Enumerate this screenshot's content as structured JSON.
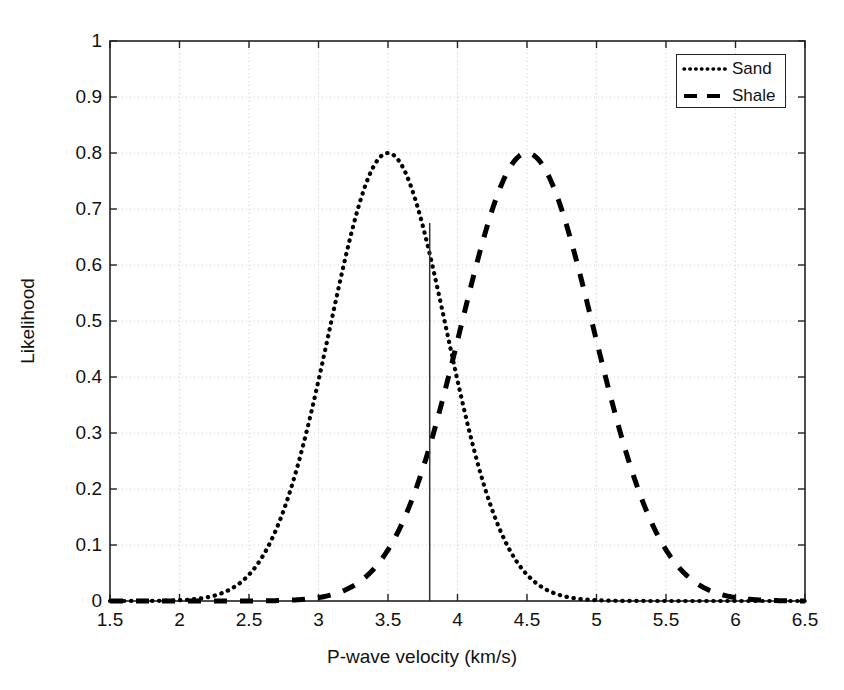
{
  "chart_data": {
    "type": "line",
    "title": "",
    "xlabel": "P-wave velocity  (km/s)",
    "ylabel": "Likelihood",
    "xlim": [
      1.5,
      6.5
    ],
    "ylim": [
      0,
      1
    ],
    "grid": true,
    "legend_position": "top-right",
    "x_ticks": [
      "1.5",
      "2",
      "2.5",
      "3",
      "3.5",
      "4",
      "4.5",
      "5",
      "5.5",
      "6",
      "6.5"
    ],
    "x_tick_values": [
      1.5,
      2,
      2.5,
      3,
      3.5,
      4,
      4.5,
      5,
      5.5,
      6,
      6.5
    ],
    "y_ticks": [
      "0",
      "0.1",
      "0.2",
      "0.3",
      "0.4",
      "0.5",
      "0.6",
      "0.7",
      "0.8",
      "0.9",
      "1"
    ],
    "y_tick_values": [
      0,
      0.1,
      0.2,
      0.3,
      0.4,
      0.5,
      0.6,
      0.7,
      0.8,
      0.9,
      1
    ],
    "series": [
      {
        "name": "Sand",
        "style": "dotted",
        "color": "#000000",
        "peak_x": 3.5,
        "peak_y": 0.8,
        "sigma": 0.42,
        "x": [
          1.5,
          1.6,
          1.7,
          1.8,
          1.9,
          2.0,
          2.1,
          2.2,
          2.3,
          2.4,
          2.5,
          2.6,
          2.7,
          2.8,
          2.9,
          3.0,
          3.1,
          3.2,
          3.3,
          3.4,
          3.5,
          3.6,
          3.7,
          3.8,
          3.9,
          4.0,
          4.1,
          4.2,
          4.3,
          4.4,
          4.5,
          4.6,
          4.7,
          4.8,
          4.9,
          5.0,
          5.1,
          5.2,
          5.3,
          5.4,
          5.5,
          5.6,
          5.7,
          5.8,
          5.9,
          6.0,
          6.1,
          6.2,
          6.3,
          6.4,
          6.5
        ],
        "values": [
          0.0,
          0.001,
          0.002,
          0.004,
          0.008,
          0.015,
          0.027,
          0.046,
          0.075,
          0.115,
          0.17,
          0.24,
          0.322,
          0.412,
          0.503,
          0.587,
          0.659,
          0.715,
          0.757,
          0.785,
          0.8,
          0.785,
          0.757,
          0.715,
          0.659,
          0.587,
          0.503,
          0.412,
          0.322,
          0.24,
          0.17,
          0.115,
          0.075,
          0.046,
          0.027,
          0.015,
          0.008,
          0.004,
          0.002,
          0.001,
          0.0,
          0.0,
          0.0,
          0.0,
          0.0,
          0.0,
          0.0,
          0.0,
          0.0,
          0.0,
          0.0
        ]
      },
      {
        "name": "Shale",
        "style": "dashed",
        "color": "#000000",
        "peak_x": 4.5,
        "peak_y": 0.8,
        "sigma": 0.48,
        "x": [
          1.5,
          1.6,
          1.7,
          1.8,
          1.9,
          2.0,
          2.1,
          2.2,
          2.3,
          2.4,
          2.5,
          2.6,
          2.7,
          2.8,
          2.9,
          3.0,
          3.1,
          3.2,
          3.3,
          3.4,
          3.5,
          3.6,
          3.7,
          3.8,
          3.9,
          4.0,
          4.1,
          4.2,
          4.3,
          4.4,
          4.5,
          4.6,
          4.7,
          4.8,
          4.9,
          5.0,
          5.1,
          5.2,
          5.3,
          5.4,
          5.5,
          5.6,
          5.7,
          5.8,
          5.9,
          6.0,
          6.1,
          6.2,
          6.3,
          6.4,
          6.5
        ],
        "values": [
          0.0,
          0.0,
          0.0,
          0.0,
          0.001,
          0.001,
          0.002,
          0.004,
          0.007,
          0.013,
          0.022,
          0.035,
          0.055,
          0.082,
          0.118,
          0.162,
          0.215,
          0.276,
          0.341,
          0.408,
          0.473,
          0.551,
          0.623,
          0.686,
          0.739,
          0.775,
          0.796,
          0.8,
          0.786,
          0.757,
          0.8,
          0.786,
          0.716,
          0.623,
          0.551,
          0.473,
          0.408,
          0.341,
          0.276,
          0.215,
          0.162,
          0.118,
          0.082,
          0.055,
          0.035,
          0.022,
          0.013,
          0.007,
          0.004,
          0.002,
          0.001
        ]
      }
    ],
    "annotations": [
      {
        "name": "threshold-line",
        "type": "vline",
        "x": 3.8,
        "y_from": 0,
        "y_to": 0.675,
        "color": "#333333"
      }
    ]
  },
  "legend": {
    "items": [
      {
        "label": "Sand",
        "style": "dotted"
      },
      {
        "label": "Shale",
        "style": "dashed"
      }
    ]
  },
  "axes": {
    "x_title": "P-wave velocity  (km/s)",
    "y_title": "Likelihood"
  }
}
